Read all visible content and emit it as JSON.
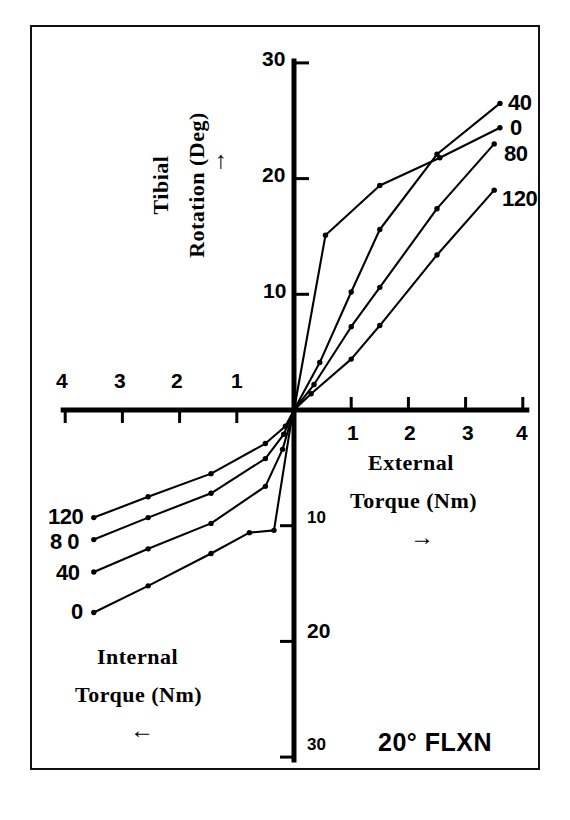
{
  "figure": {
    "background_color": "#ffffff",
    "ink_color": "#000000",
    "frame_color": "#111111"
  },
  "annotation": {
    "flexion_note": "20° FLXN"
  },
  "axes": {
    "y_title_line1": "Tibial",
    "y_title_line2": "Rotation (Deg)",
    "y_arrow": "↑",
    "x_right_title_line1": "External",
    "x_right_title_line2": "Torque (Nm)",
    "x_right_arrow": "→",
    "x_left_title_line1": "Internal",
    "x_left_title_line2": "Torque (Nm)",
    "x_left_arrow": "←",
    "y_ticks_positive": [
      "30",
      "20",
      "10"
    ],
    "y_ticks_negative": [
      "10",
      "20",
      "30"
    ],
    "x_ticks_left": [
      "4",
      "3",
      "2",
      "1"
    ],
    "x_ticks_right": [
      "1",
      "2",
      "3",
      "4"
    ]
  },
  "curve_labels": {
    "upper_right": [
      "40",
      "0",
      "80",
      "120"
    ],
    "lower_left": [
      "120",
      "8 0",
      "40",
      "0"
    ]
  },
  "chart_data": {
    "type": "line",
    "title": "",
    "subtitle": "20° FLXN",
    "xlabel": "Torque (Nm)  ← Internal / External →",
    "ylabel": "Tibial Rotation (Deg)",
    "xlim": [
      -4,
      4
    ],
    "ylim": [
      -30,
      30
    ],
    "xticks": [
      -4,
      -3,
      -2,
      -1,
      1,
      2,
      3,
      4
    ],
    "xticklabels": [
      "4",
      "3",
      "2",
      "1",
      "1",
      "2",
      "3",
      "4"
    ],
    "yticks": [
      -30,
      -20,
      -10,
      10,
      20,
      30
    ],
    "yticklabels": [
      "30",
      "20",
      "10",
      "10",
      "20",
      "30"
    ],
    "grid": false,
    "legend_position": "inline-end-of-curve",
    "x_unit": "Nm",
    "y_unit": "Deg",
    "series": [
      {
        "name": "0",
        "label_upper_right": "0",
        "label_lower_left": "0",
        "points": [
          [
            -3.5,
            -17.5
          ],
          [
            -2.55,
            -15.2
          ],
          [
            -1.45,
            -12.4
          ],
          [
            -0.78,
            -10.6
          ],
          [
            -0.35,
            -10.4
          ],
          [
            -0.02,
            -0.1
          ],
          [
            0.0,
            0.0
          ],
          [
            0.55,
            15.1
          ],
          [
            1.5,
            19.4
          ],
          [
            2.55,
            21.8
          ],
          [
            3.6,
            24.4
          ]
        ]
      },
      {
        "name": "40",
        "label_upper_right": "40",
        "label_lower_left": "40",
        "points": [
          [
            -3.5,
            -14.0
          ],
          [
            -2.55,
            -12.0
          ],
          [
            -1.45,
            -9.8
          ],
          [
            -0.5,
            -6.6
          ],
          [
            -0.2,
            -3.4
          ],
          [
            0.0,
            0.0
          ],
          [
            0.45,
            4.1
          ],
          [
            1.0,
            10.2
          ],
          [
            1.5,
            15.6
          ],
          [
            2.5,
            22.1
          ],
          [
            3.6,
            26.5
          ]
        ]
      },
      {
        "name": "80",
        "label_upper_right": "80",
        "label_lower_left": "8 0",
        "points": [
          [
            -3.5,
            -11.2
          ],
          [
            -2.55,
            -9.3
          ],
          [
            -1.45,
            -7.2
          ],
          [
            -0.5,
            -4.2
          ],
          [
            -0.18,
            -2.1
          ],
          [
            0.0,
            0.0
          ],
          [
            0.35,
            2.2
          ],
          [
            1.0,
            7.2
          ],
          [
            1.5,
            10.6
          ],
          [
            2.5,
            17.4
          ],
          [
            3.5,
            23.0
          ]
        ]
      },
      {
        "name": "120",
        "label_upper_right": "120",
        "label_lower_left": "120",
        "points": [
          [
            -3.5,
            -9.3
          ],
          [
            -2.55,
            -7.5
          ],
          [
            -1.45,
            -5.5
          ],
          [
            -0.5,
            -2.9
          ],
          [
            -0.15,
            -1.4
          ],
          [
            0.0,
            0.0
          ],
          [
            0.3,
            1.4
          ],
          [
            1.0,
            4.4
          ],
          [
            1.5,
            7.3
          ],
          [
            2.5,
            13.4
          ],
          [
            3.5,
            19.0
          ]
        ]
      }
    ]
  }
}
